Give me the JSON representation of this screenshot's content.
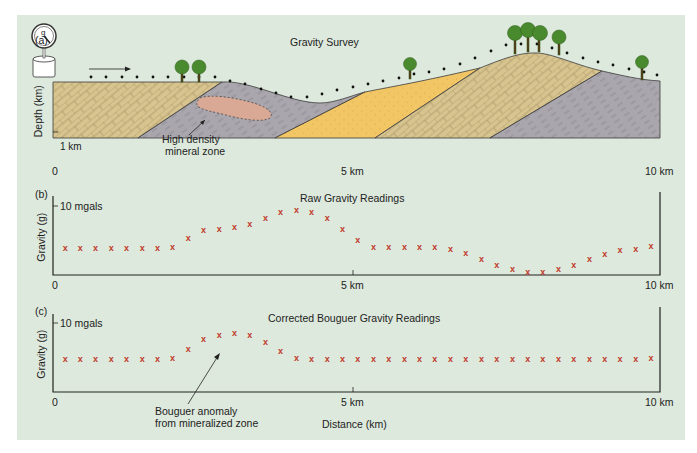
{
  "panels": {
    "a": {
      "letter": "(a)",
      "title": "Gravity Survey",
      "ylabel": "Depth (km)",
      "depth_tick": "1 km",
      "x_ticks": [
        "0",
        "5 km",
        "10 km"
      ],
      "annotation": [
        "High density",
        "mineral zone"
      ],
      "instrument_icon": "gravimeter-gauge-icon"
    },
    "b": {
      "letter": "(b)",
      "title": "Raw Gravity Readings",
      "ylabel": "Gravity (g)",
      "y_tick": "10 mgals",
      "x_ticks": [
        "0",
        "5 km",
        "10 km"
      ]
    },
    "c": {
      "letter": "(c)",
      "title": "Corrected Bouguer Gravity Readings",
      "ylabel": "Gravity (g)",
      "y_tick": "10 mgals",
      "x_ticks": [
        "0",
        "5 km",
        "10 km"
      ],
      "annotation": [
        "Bouguer anomaly",
        "from mineralized zone"
      ],
      "xlabel": "Distance (km)"
    }
  },
  "colors": {
    "background": "#dde9dc",
    "marker": "#c0392b",
    "limestone": "#d8c48e",
    "shale": "#a9a6ad",
    "sandstone": "#f2c665",
    "mineral_zone": "#d9a996",
    "tree": "#4a8a2e"
  },
  "chart_data": [
    {
      "type": "scatter",
      "title": "Raw Gravity Readings",
      "xlabel": "Distance (km)",
      "ylabel": "Gravity (g)",
      "xlim": [
        0,
        10
      ],
      "ylim": [
        0,
        10
      ],
      "y_units": "mgals",
      "x": [
        0.2,
        0.45,
        0.7,
        0.96,
        1.21,
        1.47,
        1.72,
        1.97,
        2.23,
        2.48,
        2.74,
        2.99,
        3.24,
        3.5,
        3.75,
        4.01,
        4.26,
        4.52,
        4.77,
        5.02,
        5.28,
        5.53,
        5.79,
        6.04,
        6.29,
        6.55,
        6.8,
        7.06,
        7.31,
        7.57,
        7.82,
        8.07,
        8.33,
        8.58,
        8.84,
        9.09,
        9.34,
        9.6,
        9.85
      ],
      "values": [
        3.9,
        3.9,
        3.9,
        3.9,
        3.9,
        3.9,
        3.9,
        4.0,
        5.4,
        6.5,
        6.7,
        7.0,
        7.4,
        8.3,
        9.1,
        9.4,
        9.1,
        8.3,
        6.7,
        5.1,
        4.0,
        4.0,
        4.0,
        4.0,
        4.0,
        3.8,
        3.2,
        2.3,
        1.5,
        0.8,
        0.4,
        0.4,
        0.8,
        1.4,
        2.3,
        3.0,
        3.6,
        3.8,
        4.2
      ]
    },
    {
      "type": "scatter",
      "title": "Corrected Bouguer Gravity Readings",
      "xlabel": "Distance (km)",
      "ylabel": "Gravity (g)",
      "xlim": [
        0,
        10
      ],
      "ylim": [
        0,
        10
      ],
      "y_units": "mgals",
      "x": [
        0.2,
        0.45,
        0.7,
        0.96,
        1.21,
        1.47,
        1.72,
        1.97,
        2.23,
        2.48,
        2.74,
        2.99,
        3.24,
        3.5,
        3.75,
        4.01,
        4.26,
        4.52,
        4.77,
        5.02,
        5.28,
        5.53,
        5.79,
        6.04,
        6.29,
        6.55,
        6.8,
        7.06,
        7.31,
        7.57,
        7.82,
        8.07,
        8.33,
        8.58,
        8.84,
        9.09,
        9.34,
        9.6,
        9.85
      ],
      "values": [
        4.8,
        4.8,
        4.8,
        4.8,
        4.8,
        4.8,
        4.8,
        4.9,
        6.2,
        7.7,
        8.3,
        8.5,
        8.2,
        7.2,
        5.9,
        4.9,
        4.8,
        4.8,
        4.8,
        4.8,
        4.8,
        4.8,
        4.8,
        4.8,
        4.8,
        4.8,
        4.8,
        4.8,
        4.8,
        4.8,
        4.8,
        4.8,
        4.8,
        4.8,
        4.8,
        4.8,
        4.8,
        4.8,
        4.9
      ],
      "annotation": "Bouguer anomaly from mineralized zone"
    }
  ]
}
